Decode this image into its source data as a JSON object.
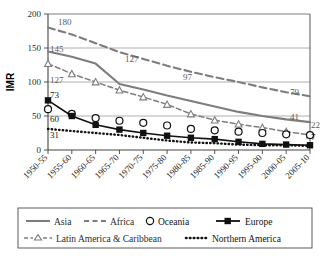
{
  "chart_data": {
    "type": "line",
    "title": "",
    "xlabel": "",
    "ylabel": "IMR",
    "ylim": [
      0,
      200
    ],
    "yticks": [
      0,
      50,
      100,
      150,
      200
    ],
    "grid": true,
    "legend_position": "bottom",
    "categories": [
      "1950-55",
      "1955-60",
      "1960-65",
      "1965-70",
      "1970-75",
      "1975-80",
      "1980-85",
      "1985-90",
      "1990-95",
      "1995-00",
      "2000-05",
      "2005-10"
    ],
    "series": [
      {
        "name": "Asia",
        "style": "solid-gray",
        "values": [
          145,
          137,
          127,
          97,
          89,
          80,
          72,
          64,
          56,
          50,
          45,
          41
        ]
      },
      {
        "name": "Africa",
        "style": "dashed-gray",
        "values": [
          180,
          170,
          157,
          144,
          134,
          124,
          115,
          107,
          100,
          92,
          85,
          79
        ]
      },
      {
        "name": "Oceania",
        "style": "open-circle",
        "values": [
          60,
          53,
          47,
          43,
          40,
          36,
          31,
          29,
          27,
          25,
          23,
          22
        ]
      },
      {
        "name": "Europe",
        "style": "black-square",
        "values": [
          73,
          50,
          37,
          30,
          25,
          21,
          18,
          16,
          12,
          9,
          8,
          7
        ]
      },
      {
        "name": "Latin America & Caribbean",
        "style": "dashed-triangle",
        "values": [
          127,
          112,
          100,
          88,
          78,
          67,
          53,
          44,
          38,
          33,
          27,
          22
        ]
      },
      {
        "name": "Northern America",
        "style": "dotted-black",
        "values": [
          31,
          28,
          25,
          22,
          18,
          14,
          11,
          10,
          8,
          7,
          7,
          6
        ]
      }
    ],
    "data_labels": [
      {
        "text": "180",
        "series": "Africa",
        "position": "start"
      },
      {
        "text": "145",
        "series": "Asia",
        "position": "start"
      },
      {
        "text": "127",
        "series": "Latin America & Caribbean",
        "position": "start"
      },
      {
        "text": "73",
        "series": "Europe",
        "position": "start"
      },
      {
        "text": "60",
        "series": "Oceania",
        "position": "start"
      },
      {
        "text": "31",
        "series": "Northern America",
        "position": "start"
      },
      {
        "text": "127",
        "series": "Asia",
        "position": "middle"
      },
      {
        "text": "97",
        "series": "Asia",
        "position": "middle"
      },
      {
        "text": "79",
        "series": "Africa",
        "position": "end"
      },
      {
        "text": "41",
        "series": "Asia",
        "position": "end"
      },
      {
        "text": "22",
        "series": "Latin America & Caribbean",
        "position": "end"
      },
      {
        "text": "7",
        "series": "Europe",
        "position": "end"
      }
    ]
  },
  "legend": {
    "items": [
      {
        "label": "Asia",
        "marker": "solid-gray-line"
      },
      {
        "label": "Africa",
        "marker": "dashed-gray-line"
      },
      {
        "label": "Oceania",
        "marker": "open-circle"
      },
      {
        "label": "Europe",
        "marker": "black-line-square"
      },
      {
        "label": "Latin America & Caribbean",
        "marker": "dashed-triangle"
      },
      {
        "label": "Northern America",
        "marker": "dotted-line"
      }
    ]
  },
  "colors": {
    "gray_series": "#7d7d7d",
    "black_series": "#111111",
    "grid": "#9a9a9a",
    "axis": "#444444",
    "label_gray": "#5a5a5a"
  }
}
